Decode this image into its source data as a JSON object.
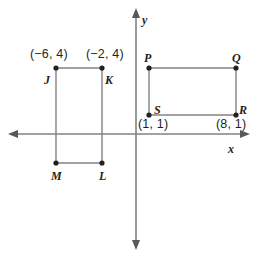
{
  "figure": {
    "type": "coordinate-plane-diagram",
    "background_color": "#ffffff",
    "stroke_color": "#808285",
    "text_color": "#231f20",
    "width": 258,
    "height": 257
  },
  "axes": {
    "origin_px": [
      136,
      134
    ],
    "x_axis": {
      "label": "x",
      "label_px": [
        228,
        143
      ],
      "start_px": [
        8,
        134
      ],
      "end_px": [
        250,
        134
      ],
      "arrow_left": true,
      "arrow_right": true
    },
    "y_axis": {
      "label": "y",
      "label_px": [
        142,
        14
      ],
      "start_px": [
        136,
        8
      ],
      "end_px": [
        136,
        250
      ],
      "arrow_up": true,
      "arrow_down": true
    },
    "tick_marks": false,
    "grid": false
  },
  "shapes": [
    {
      "name": "rectangle-JKLM",
      "vertices": [
        {
          "name": "J",
          "label": "J",
          "label_px": [
            44,
            74
          ],
          "point_px": [
            56,
            68
          ],
          "coordinate_label": "(−6, 4)",
          "coordinate_label_px": [
            30,
            48
          ]
        },
        {
          "name": "K",
          "label": "K",
          "label_px": [
            105,
            74
          ],
          "point_px": [
            102,
            68
          ],
          "coordinate_label": "(−2, 4)",
          "coordinate_label_px": [
            86,
            48
          ]
        },
        {
          "name": "L",
          "label": "L",
          "label_px": [
            99,
            170
          ],
          "point_px": [
            102,
            163
          ],
          "coordinate_label": "",
          "coordinate_label_px": [
            0,
            0
          ]
        },
        {
          "name": "M",
          "label": "M",
          "label_px": [
            51,
            170
          ],
          "point_px": [
            56,
            163
          ],
          "coordinate_label": "",
          "coordinate_label_px": [
            0,
            0
          ]
        }
      ]
    },
    {
      "name": "rectangle-PQRS",
      "vertices": [
        {
          "name": "P",
          "label": "P",
          "label_px": [
            144,
            52
          ],
          "point_px": [
            149,
            68
          ],
          "coordinate_label": "",
          "coordinate_label_px": [
            0,
            0
          ]
        },
        {
          "name": "Q",
          "label": "Q",
          "label_px": [
            232,
            52
          ],
          "point_px": [
            236,
            68
          ],
          "coordinate_label": "",
          "coordinate_label_px": [
            0,
            0
          ]
        },
        {
          "name": "R",
          "label": "R",
          "label_px": [
            239,
            104
          ],
          "point_px": [
            236,
            115
          ],
          "coordinate_label": "(8, 1)",
          "coordinate_label_px": [
            216,
            118
          ]
        },
        {
          "name": "S",
          "label": "S",
          "label_px": [
            154,
            104
          ],
          "point_px": [
            149,
            115
          ],
          "coordinate_label": "(1, 1)",
          "coordinate_label_px": [
            138,
            118
          ]
        }
      ]
    }
  ]
}
